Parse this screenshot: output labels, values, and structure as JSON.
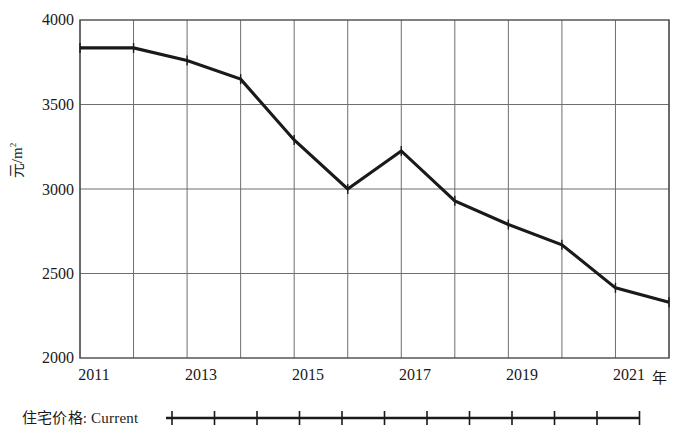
{
  "chart_data": {
    "type": "line",
    "title": "",
    "subtitle": "",
    "xlabel": "年",
    "ylabel": "元/m²",
    "x": [
      2011,
      2012,
      2013,
      2014,
      2015,
      2016,
      2017,
      2018,
      2019,
      2020,
      2021,
      2022
    ],
    "categories": [
      "2011",
      "2012",
      "2013",
      "2014",
      "2015",
      "2016",
      "2017",
      "2018",
      "2019",
      "2020",
      "2021",
      "2022"
    ],
    "series": [
      {
        "name": "住宅价格: Current",
        "values": [
          3835,
          3835,
          3760,
          3650,
          3290,
          3000,
          3225,
          2930,
          2790,
          2670,
          2415,
          2330
        ]
      }
    ],
    "xlim": [
      2011,
      2022
    ],
    "ylim": [
      2000,
      4000
    ],
    "ytick_labels": [
      "4000",
      "3500",
      "3000",
      "2500",
      "2000"
    ],
    "ytick_values": [
      4000,
      3500,
      3000,
      2500,
      2000
    ],
    "xtick_labels": [
      "2011",
      "2013",
      "2015",
      "2017",
      "2019",
      "2021"
    ],
    "xtick_values": [
      2011,
      2013,
      2015,
      2017,
      2019,
      2021
    ],
    "grid": true,
    "grid_x": true,
    "grid_y": true,
    "legend_position": "below-left",
    "line_color": "#1a1a1a",
    "grid_color": "#6e6e6e",
    "axis_color": "#4a4a4a",
    "marker": "vertical-tick"
  },
  "axes": {
    "y_unit_prefix": "元/m",
    "y_unit_exponent": "2",
    "x_unit": "年"
  },
  "legend": {
    "label": "住宅价格: Current"
  }
}
